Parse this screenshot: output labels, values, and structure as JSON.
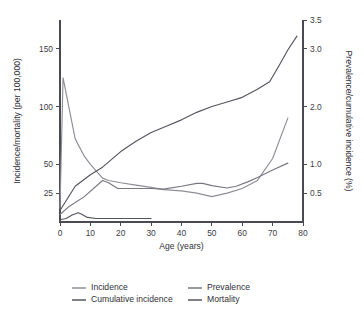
{
  "chart_data": {
    "type": "line",
    "title": "",
    "subtitle": "",
    "xlabel": "Age (years)",
    "ylabel": "Incidence/mortality (per 100,000)",
    "y2label": "Prevalence/cumulative incidence (%)",
    "grid": false,
    "legend_position": "bottom",
    "xlim": [
      0,
      80
    ],
    "xticks": [
      0,
      10,
      20,
      30,
      40,
      50,
      60,
      70,
      80
    ],
    "xtick_labels": [
      "0",
      "10",
      "20",
      "30",
      "40",
      "50",
      "60",
      "70",
      "80"
    ],
    "ylim": [
      0,
      175
    ],
    "yticks": [
      25,
      50,
      100,
      150
    ],
    "ytick_labels": [
      "25",
      "50",
      "100",
      "150"
    ],
    "y2lim": [
      0,
      3.5
    ],
    "y2ticks": [
      0.5,
      1.0,
      2.0,
      3.0,
      3.5
    ],
    "y2tick_labels": [
      "0.5",
      "1.0",
      "2.0",
      "3.0",
      "3.5"
    ],
    "series": [
      {
        "name": "Incidence",
        "axis": "left",
        "color": "#8e8e97",
        "x": [
          0,
          1,
          5,
          8,
          10,
          14,
          16,
          20,
          25,
          30,
          34,
          40,
          45,
          50,
          55,
          60,
          65,
          70,
          75
        ],
        "values": [
          12,
          125,
          72,
          57,
          50,
          38,
          36,
          34,
          32,
          30,
          28,
          27,
          25,
          22,
          25,
          29,
          36,
          55,
          90
        ]
      },
      {
        "name": "Cumulative incidence",
        "axis": "right",
        "color": "#55555f",
        "x": [
          0,
          5,
          10,
          14,
          20,
          25,
          30,
          35,
          40,
          45,
          50,
          55,
          60,
          65,
          69,
          72,
          75,
          78
        ],
        "values": [
          0.2,
          0.62,
          0.82,
          0.95,
          1.22,
          1.4,
          1.55,
          1.66,
          1.77,
          1.9,
          2.0,
          2.08,
          2.16,
          2.3,
          2.43,
          2.7,
          2.98,
          3.22
        ]
      },
      {
        "name": "Prevalence",
        "axis": "right",
        "color": "#777780",
        "x": [
          0,
          3,
          8,
          14,
          16,
          19,
          25,
          30,
          34,
          40,
          45,
          47,
          50,
          55,
          58,
          62,
          65,
          70,
          75
        ],
        "values": [
          0.13,
          0.27,
          0.44,
          0.72,
          0.68,
          0.58,
          0.58,
          0.58,
          0.57,
          0.62,
          0.67,
          0.67,
          0.63,
          0.59,
          0.62,
          0.7,
          0.77,
          0.9,
          1.02
        ]
      },
      {
        "name": "Mortality",
        "axis": "left",
        "color": "#55555f",
        "x": [
          0,
          2,
          4,
          6,
          7,
          9,
          12,
          18,
          24,
          30
        ],
        "values": [
          2,
          3,
          6,
          8,
          7,
          4,
          3,
          3,
          3,
          3
        ]
      }
    ],
    "legend": [
      {
        "label": "Incidence",
        "color": "#8e8e97"
      },
      {
        "label": "Prevalence",
        "color": "#777780"
      },
      {
        "label": "Cumulative incidence",
        "color": "#55555f"
      },
      {
        "label": "Mortality",
        "color": "#55555f"
      }
    ]
  },
  "axis_colors": {
    "axis": "#4a4a55",
    "text": "#2f2f38",
    "background": "#ffffff"
  }
}
